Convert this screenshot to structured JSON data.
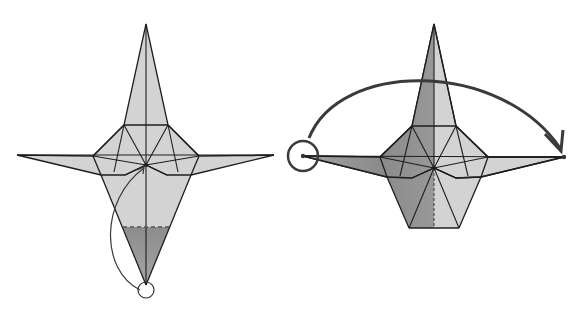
{
  "diagram": {
    "type": "origami-instruction",
    "width": 580,
    "height": 314,
    "colors": {
      "paper": "#d3d3d3",
      "shade": "#8a8a8a",
      "stroke": "#1e1e1e",
      "arrow": "#3a3a3a",
      "background": "#ffffff"
    },
    "steps": [
      {
        "id": "step-left",
        "description": "Fold bottom tip up to center (valley fold along dashed line)",
        "outline": "146,24 168,125 199,156 274,155 191,175 167,175 146,165 125,175 101,175 17,155 93,156 124,125",
        "body": "124,125 168,125 199,156 191,175 146,285 101,175 93,156",
        "shaded": "123,227 170,227 146,285",
        "dashed_line": [
          123,
          227,
          170,
          227
        ],
        "creases": [
          [
            146,
            24,
            146,
            285
          ],
          [
            17,
            155,
            274,
            155
          ],
          [
            124,
            125,
            146,
            165
          ],
          [
            168,
            125,
            146,
            165
          ],
          [
            124,
            125,
            114,
            172
          ],
          [
            168,
            125,
            178,
            172
          ],
          [
            93,
            156,
            146,
            165
          ],
          [
            199,
            156,
            146,
            165
          ],
          [
            125,
            175,
            146,
            165
          ],
          [
            167,
            175,
            146,
            165
          ]
        ],
        "center": [
          146,
          165
        ],
        "arrow_path": "M140,290 C100,270 100,200 144,168",
        "target_circle": {
          "cx": 146,
          "cy": 290,
          "r": 8
        }
      },
      {
        "id": "step-right",
        "description": "Swing the left wing over to the right (turn flap)",
        "outline": "434,24 456,126 488,157 564,157 481,177 456,178 434,168 412,178 387,177 303,156 380,157 412,126",
        "body": "412,126 456,126 488,157 481,177 459,228 409,228 387,177 380,157",
        "shaded_left": "434,24 434,228 409,228 387,177 303,156 380,157 412,126",
        "dashed_center": [
          434,
          168,
          434,
          228
        ],
        "creases": [
          [
            434,
            24,
            434,
            168
          ],
          [
            303,
            156,
            564,
            157
          ],
          [
            412,
            126,
            434,
            168
          ],
          [
            456,
            126,
            434,
            168
          ],
          [
            412,
            126,
            400,
            176
          ],
          [
            456,
            126,
            468,
            176
          ],
          [
            380,
            157,
            434,
            168
          ],
          [
            488,
            157,
            434,
            168
          ],
          [
            412,
            178,
            434,
            168
          ],
          [
            456,
            178,
            434,
            168
          ],
          [
            434,
            168,
            409,
            228
          ],
          [
            434,
            168,
            459,
            228
          ]
        ],
        "center": [
          434,
          168
        ],
        "arrow_path": "M309,138 C340,60 500,60 560,148",
        "arrowhead": "545,134 561,151 563,130",
        "source_circle": {
          "cx": 303,
          "cy": 156,
          "r": 15
        },
        "dots": [
          [
            303,
            156
          ],
          [
            564,
            157
          ]
        ]
      }
    ]
  }
}
